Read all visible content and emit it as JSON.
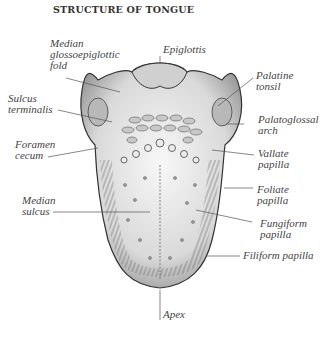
{
  "title": "STRUCTURE OF TONGUE",
  "labels": {
    "median_glossoepiglottic_fold": "Median\nglossoepiglottic\nfold",
    "epiglottis": "Epiglottis",
    "palatine_tonsil": "Palatine\ntonsil",
    "sulcus_terminalis": "Sulcus\nterminalis",
    "palatoglossal_arch": "Palatoglossal\narch",
    "foramen_cecum": "Foramen\ncecum",
    "vallate_papilla": "Vallate\npapilla",
    "median_sulcus": "Median\nsulcus",
    "foliate_papilla": "Foliate\npapilla",
    "fungiform_papilla": "Fungiform\npapilla",
    "filiform_papilla": "Filiform papilla",
    "apex": "Apex"
  },
  "colors": {
    "ink": "#444444",
    "tongue_fill": "#e6e6e6",
    "shade": "#8a8a8a"
  }
}
